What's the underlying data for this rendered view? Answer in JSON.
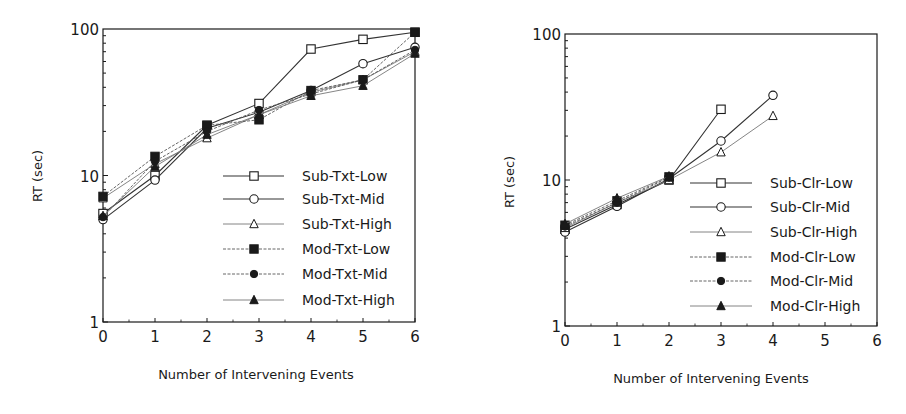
{
  "figure": {
    "background": "#ffffff",
    "ink": "#1a1a1a"
  },
  "chart_data": [
    {
      "type": "line",
      "id": "left",
      "title": "",
      "xlabel": "Number of Intervening Events",
      "ylabel": "RT (sec)",
      "yscale": "log",
      "xlim": [
        0,
        6
      ],
      "ylim": [
        1,
        100
      ],
      "xticks": [
        "0",
        "1",
        "2",
        "3",
        "4",
        "5",
        "6"
      ],
      "yticks": [
        "1",
        "10",
        "100"
      ],
      "grid": false,
      "legend_position": "lower right (inside)",
      "x": [
        0,
        1,
        2,
        3,
        4,
        5,
        6
      ],
      "series": [
        {
          "name": "Sub-Txt-Low",
          "marker": "square-open",
          "line": "solid",
          "values": [
            5.5,
            10.0,
            22.0,
            31.0,
            73.0,
            85.0,
            95.0
          ]
        },
        {
          "name": "Sub-Txt-Mid",
          "marker": "circle-open",
          "line": "solid",
          "values": [
            5.0,
            9.3,
            21.0,
            27.0,
            38.0,
            58.0,
            75.0
          ]
        },
        {
          "name": "Sub-Txt-High",
          "marker": "triangle-open",
          "line": "light",
          "values": [
            7.0,
            12.0,
            18.0,
            26.0,
            37.0,
            45.0,
            70.0
          ]
        },
        {
          "name": "Mod-Txt-Low",
          "marker": "square-filled",
          "line": "dashed",
          "values": [
            7.2,
            13.5,
            22.0,
            24.0,
            38.0,
            45.0,
            95.0
          ]
        },
        {
          "name": "Mod-Txt-Mid",
          "marker": "circle-filled",
          "line": "dashed",
          "values": [
            5.2,
            12.5,
            20.0,
            28.0,
            36.0,
            45.0,
            72.0
          ]
        },
        {
          "name": "Mod-Txt-High",
          "marker": "triangle-filled",
          "line": "light",
          "values": [
            5.3,
            11.5,
            19.0,
            26.0,
            35.0,
            41.0,
            68.0
          ]
        }
      ]
    },
    {
      "type": "line",
      "id": "right",
      "title": "",
      "xlabel": "Number of Intervening Events",
      "ylabel": "RT (sec)",
      "yscale": "log",
      "xlim": [
        0,
        6
      ],
      "ylim": [
        1,
        100
      ],
      "xticks": [
        "0",
        "1",
        "2",
        "3",
        "4",
        "5",
        "6"
      ],
      "yticks": [
        "1",
        "10",
        "100"
      ],
      "grid": false,
      "legend_position": "lower right (inside)",
      "x": [
        0,
        1,
        2,
        3,
        4
      ],
      "series": [
        {
          "name": "Sub-Clr-Low",
          "marker": "square-open",
          "line": "solid",
          "values": [
            4.6,
            6.8,
            10.0,
            30.5,
            null
          ]
        },
        {
          "name": "Sub-Clr-Mid",
          "marker": "circle-open",
          "line": "solid",
          "values": [
            4.4,
            6.6,
            10.2,
            18.5,
            38.0
          ]
        },
        {
          "name": "Sub-Clr-High",
          "marker": "triangle-open",
          "line": "light",
          "values": [
            4.7,
            7.0,
            10.0,
            15.5,
            27.5
          ]
        },
        {
          "name": "Mod-Clr-Low",
          "marker": "square-filled",
          "line": "dashed",
          "values": [
            4.9,
            7.2,
            10.5,
            null,
            null
          ]
        },
        {
          "name": "Mod-Clr-Mid",
          "marker": "circle-filled",
          "line": "dashed",
          "values": [
            4.8,
            7.0,
            10.4,
            null,
            null
          ]
        },
        {
          "name": "Mod-Clr-High",
          "marker": "triangle-filled",
          "line": "light",
          "values": [
            5.0,
            7.5,
            10.6,
            null,
            null
          ]
        }
      ]
    }
  ]
}
